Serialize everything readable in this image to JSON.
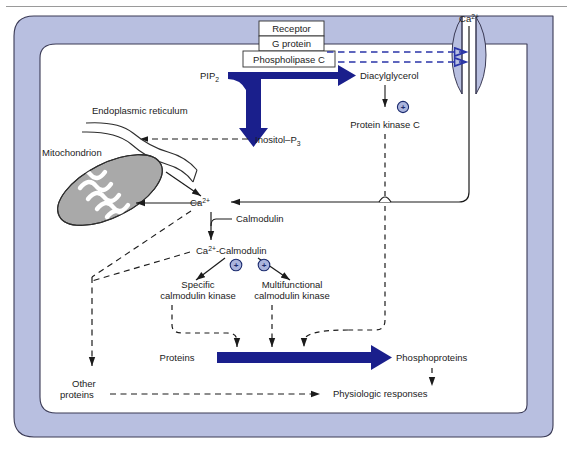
{
  "figure": {
    "colors": {
      "membrane_fill": "#b8bfe0",
      "membrane_stroke": "#3a3a55",
      "arrow_blue": "#1a1f8c",
      "dashed_blue": "#2a35a8",
      "mitochondrion_fill": "#a9a9a9",
      "cytoplasm_fill": "#ffffff",
      "text": "#1b1b1b",
      "badge_fill": "#aab4dd",
      "frame_stroke": "#9a9a9a"
    }
  },
  "membrane_proteins": {
    "receptor": "Receptor",
    "g_protein": "G protein",
    "phospholipase_c": "Phospholipase C"
  },
  "molecules": {
    "pip2": {
      "base": "PIP",
      "sub": "2"
    },
    "diacylglycerol": "Diacylglycerol",
    "inositol_p3": {
      "base": "Inositol–P",
      "sub": "3"
    },
    "protein_kinase_c": "Protein kinase C",
    "calcium_extracellular": {
      "base": "Ca",
      "sup": "2+"
    },
    "calcium_cytosolic": {
      "base": "Ca",
      "sup": "2+"
    },
    "calmodulin": "Calmodulin",
    "ca_calmodulin": {
      "base": "Ca",
      "sup": "2+",
      "tail": "-Calmodulin"
    }
  },
  "organelles": {
    "endoplasmic_reticulum": "Endoplasmic reticulum",
    "mitochondrion": "Mitochondrion"
  },
  "kinases": {
    "specific": {
      "line1": "Specific",
      "line2": "calmodulin kinase"
    },
    "multifunctional": {
      "line1": "Multifunctional",
      "line2": "calmodulin kinase"
    }
  },
  "outputs": {
    "proteins": "Proteins",
    "phosphoproteins": "Phosphoproteins",
    "other_proteins": {
      "line1": "Other",
      "line2": "proteins"
    },
    "physiologic_responses": "Physiologic responses"
  },
  "badges": {
    "activation_symbol": "+",
    "count": 3
  }
}
